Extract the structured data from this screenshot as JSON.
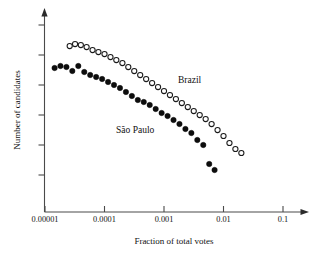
{
  "chart_data": {
    "type": "scatter",
    "title": "",
    "xlabel": "Fraction of total votes",
    "ylabel": "Number of candidates",
    "xscale": "log",
    "yscale": "log",
    "xlim": [
      1e-05,
      0.3
    ],
    "grid": false,
    "legend_position": "inline-annotations",
    "xticks": [
      {
        "value": 1e-05,
        "label": "0.00001"
      },
      {
        "value": 0.0001,
        "label": "0.0001"
      },
      {
        "value": 0.001,
        "label": "0.001"
      },
      {
        "value": 0.01,
        "label": "0.01"
      },
      {
        "value": 0.1,
        "label": "0.1"
      }
    ],
    "yticks": [
      {
        "label": ""
      },
      {
        "label": ""
      },
      {
        "label": ""
      },
      {
        "label": ""
      },
      {
        "label": ""
      },
      {
        "label": ""
      }
    ],
    "annotations": [
      {
        "text": "Brazil",
        "x": 0.0045,
        "y_px": 80
      },
      {
        "text": "São Paulo",
        "x": 0.00035,
        "y_px": 130
      }
    ],
    "series": [
      {
        "name": "Brazil",
        "marker": "open-circle",
        "color": "#1a1a1a",
        "points": [
          {
            "x": 2.6e-05,
            "y_px": 46
          },
          {
            "x": 3.2e-05,
            "y_px": 44
          },
          {
            "x": 4e-05,
            "y_px": 45
          },
          {
            "x": 5e-05,
            "y_px": 47
          },
          {
            "x": 6.3e-05,
            "y_px": 50
          },
          {
            "x": 7.9e-05,
            "y_px": 52
          },
          {
            "x": 0.0001,
            "y_px": 54
          },
          {
            "x": 0.000126,
            "y_px": 57
          },
          {
            "x": 0.000158,
            "y_px": 60
          },
          {
            "x": 0.0002,
            "y_px": 63
          },
          {
            "x": 0.000251,
            "y_px": 67
          },
          {
            "x": 0.000316,
            "y_px": 71
          },
          {
            "x": 0.000398,
            "y_px": 75
          },
          {
            "x": 0.000501,
            "y_px": 79
          },
          {
            "x": 0.000631,
            "y_px": 83
          },
          {
            "x": 0.000794,
            "y_px": 87
          },
          {
            "x": 0.001,
            "y_px": 91
          },
          {
            "x": 0.001259,
            "y_px": 95
          },
          {
            "x": 0.001585,
            "y_px": 99
          },
          {
            "x": 0.001995,
            "y_px": 103
          },
          {
            "x": 0.002512,
            "y_px": 107
          },
          {
            "x": 0.003162,
            "y_px": 111
          },
          {
            "x": 0.003981,
            "y_px": 115
          },
          {
            "x": 0.005012,
            "y_px": 119
          },
          {
            "x": 0.00631,
            "y_px": 124
          },
          {
            "x": 0.007943,
            "y_px": 130
          },
          {
            "x": 0.01,
            "y_px": 136
          },
          {
            "x": 0.012589,
            "y_px": 143
          },
          {
            "x": 0.015849,
            "y_px": 149
          },
          {
            "x": 0.019953,
            "y_px": 153
          }
        ]
      },
      {
        "name": "São Paulo",
        "marker": "filled-circle",
        "color": "#0d0d0d",
        "points": [
          {
            "x": 1.45e-05,
            "y_px": 68
          },
          {
            "x": 1.82e-05,
            "y_px": 66
          },
          {
            "x": 2.29e-05,
            "y_px": 67
          },
          {
            "x": 2.88e-05,
            "y_px": 71
          },
          {
            "x": 3.63e-05,
            "y_px": 66
          },
          {
            "x": 4.57e-05,
            "y_px": 72
          },
          {
            "x": 5.75e-05,
            "y_px": 75
          },
          {
            "x": 7.24e-05,
            "y_px": 77
          },
          {
            "x": 9.12e-05,
            "y_px": 79
          },
          {
            "x": 0.0001148,
            "y_px": 82
          },
          {
            "x": 0.0001445,
            "y_px": 85
          },
          {
            "x": 0.000182,
            "y_px": 88
          },
          {
            "x": 0.0002291,
            "y_px": 92
          },
          {
            "x": 0.0002884,
            "y_px": 96
          },
          {
            "x": 0.0003631,
            "y_px": 100
          },
          {
            "x": 0.0004571,
            "y_px": 102
          },
          {
            "x": 0.0005754,
            "y_px": 105
          },
          {
            "x": 0.0007244,
            "y_px": 109
          },
          {
            "x": 0.000912,
            "y_px": 113
          },
          {
            "x": 0.0011482,
            "y_px": 116
          },
          {
            "x": 0.0014454,
            "y_px": 120
          },
          {
            "x": 0.0018197,
            "y_px": 124
          },
          {
            "x": 0.0022909,
            "y_px": 129
          },
          {
            "x": 0.002884,
            "y_px": 133
          },
          {
            "x": 0.0036308,
            "y_px": 140
          },
          {
            "x": 0.0045709,
            "y_px": 145
          },
          {
            "x": 0.0057544,
            "y_px": 164
          },
          {
            "x": 0.0070795,
            "y_px": 170
          }
        ]
      }
    ]
  }
}
